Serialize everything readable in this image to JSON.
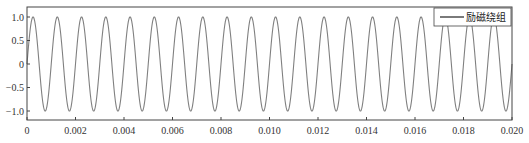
{
  "chart_data": {
    "type": "line",
    "title": "",
    "xlabel": "",
    "ylabel": "",
    "xlim": [
      0,
      0.02
    ],
    "ylim": [
      -1.1,
      1.1
    ],
    "grid": false,
    "legend_position": "upper right",
    "x_ticks": [
      "0",
      "0.002",
      "0.004",
      "0.006",
      "0.008",
      "0.010",
      "0.012",
      "0.014",
      "0.016",
      "0.018",
      "0.020"
    ],
    "y_ticks": [
      "1.0",
      "0.5",
      "0",
      "-0.5",
      "-1.0"
    ],
    "series": [
      {
        "name": "励磁绕组",
        "function": "sin(2*pi*f*t)",
        "frequency_hz": 1000,
        "amplitude": 1.0,
        "cycles": 20,
        "color": "#808080"
      }
    ]
  },
  "legend": {
    "label": "励磁绕组"
  },
  "colors": {
    "line": "#808080",
    "axis": "#333333"
  }
}
